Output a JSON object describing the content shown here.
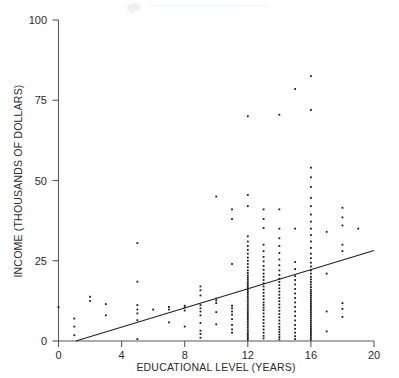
{
  "chart_data": {
    "type": "scatter",
    "title": "",
    "xlabel": "EDUCATIONAL LEVEL (YEARS)",
    "ylabel": "INCOME (THOUSANDS OF DOLLARS)",
    "xlim": [
      0,
      20
    ],
    "ylim": [
      0,
      100
    ],
    "xticks": [
      0,
      4,
      8,
      12,
      16,
      20
    ],
    "yticks": [
      0,
      25,
      50,
      75,
      100
    ],
    "xtick_labels": [
      "0",
      "4",
      "8",
      "12",
      "16",
      "20"
    ],
    "ytick_labels": [
      "0",
      "25",
      "50",
      "75",
      "100"
    ],
    "grid": false,
    "legend": null,
    "marker": "dot",
    "marker_color": "#1b1b1b",
    "axis_color": "#555a5c",
    "trendline": {
      "label": "regression line",
      "color": "#232323",
      "x_start": 1.1,
      "y_start": 0,
      "x_end": 20,
      "y_end": 28.2,
      "slope": 1.49,
      "intercept": -1.64
    },
    "points": [
      [
        0,
        10.5
      ],
      [
        1,
        1.8
      ],
      [
        1,
        4.5
      ],
      [
        1,
        7.0
      ],
      [
        2,
        12.5
      ],
      [
        2,
        13.8
      ],
      [
        3,
        8.0
      ],
      [
        3,
        11.5
      ],
      [
        5,
        0.6
      ],
      [
        5,
        6.5
      ],
      [
        5,
        8.6
      ],
      [
        5,
        9.8
      ],
      [
        5,
        11.2
      ],
      [
        5,
        18.5
      ],
      [
        5,
        30.5
      ],
      [
        6,
        9.8
      ],
      [
        7,
        5.8
      ],
      [
        7,
        9.8
      ],
      [
        7,
        10.6
      ],
      [
        8,
        4.5
      ],
      [
        8,
        9.5
      ],
      [
        8,
        10.5
      ],
      [
        8,
        11.0
      ],
      [
        9,
        1.0
      ],
      [
        9,
        2.2
      ],
      [
        9,
        3.2
      ],
      [
        9,
        5.6
      ],
      [
        9,
        8.0
      ],
      [
        9,
        9.2
      ],
      [
        9,
        10.2
      ],
      [
        9,
        11.2
      ],
      [
        9,
        14.2
      ],
      [
        9,
        15.8
      ],
      [
        9,
        17.0
      ],
      [
        10,
        5.2
      ],
      [
        10,
        9.0
      ],
      [
        10,
        11.8
      ],
      [
        10,
        12.6
      ],
      [
        10,
        13.2
      ],
      [
        10,
        45.0
      ],
      [
        11,
        2.6
      ],
      [
        11,
        3.6
      ],
      [
        11,
        5.0
      ],
      [
        11,
        6.8
      ],
      [
        11,
        8.2
      ],
      [
        11,
        9.2
      ],
      [
        11,
        10.2
      ],
      [
        11,
        11.0
      ],
      [
        11,
        24.0
      ],
      [
        11,
        38.0
      ],
      [
        11,
        41.0
      ],
      [
        12,
        0.4
      ],
      [
        12,
        0.9
      ],
      [
        12,
        1.4
      ],
      [
        12,
        1.9
      ],
      [
        12,
        2.4
      ],
      [
        12,
        3.0
      ],
      [
        12,
        3.6
      ],
      [
        12,
        4.2
      ],
      [
        12,
        4.8
      ],
      [
        12,
        5.4
      ],
      [
        12,
        6.0
      ],
      [
        12,
        6.6
      ],
      [
        12,
        7.2
      ],
      [
        12,
        7.8
      ],
      [
        12,
        8.4
      ],
      [
        12,
        9.0
      ],
      [
        12,
        9.6
      ],
      [
        12,
        10.2
      ],
      [
        12,
        10.8
      ],
      [
        12,
        11.4
      ],
      [
        12,
        12.0
      ],
      [
        12,
        12.6
      ],
      [
        12,
        13.2
      ],
      [
        12,
        13.8
      ],
      [
        12,
        14.4
      ],
      [
        12,
        15.0
      ],
      [
        12,
        15.6
      ],
      [
        12,
        16.2
      ],
      [
        12,
        16.8
      ],
      [
        12,
        17.4
      ],
      [
        12,
        18.0
      ],
      [
        12,
        18.6
      ],
      [
        12,
        19.2
      ],
      [
        12,
        19.8
      ],
      [
        12,
        20.4
      ],
      [
        12,
        21.2
      ],
      [
        12,
        22.0
      ],
      [
        12,
        23.0
      ],
      [
        12,
        24.0
      ],
      [
        12,
        25.0
      ],
      [
        12,
        26.0
      ],
      [
        12,
        27.2
      ],
      [
        12,
        28.4
      ],
      [
        12,
        29.6
      ],
      [
        12,
        31.0
      ],
      [
        12,
        32.6
      ],
      [
        12,
        42.0
      ],
      [
        12,
        45.5
      ],
      [
        12,
        70.0
      ],
      [
        13,
        0.8
      ],
      [
        13,
        1.6
      ],
      [
        13,
        2.6
      ],
      [
        13,
        3.6
      ],
      [
        13,
        4.6
      ],
      [
        13,
        5.6
      ],
      [
        13,
        6.6
      ],
      [
        13,
        7.6
      ],
      [
        13,
        8.6
      ],
      [
        13,
        9.6
      ],
      [
        13,
        10.4
      ],
      [
        13,
        11.2
      ],
      [
        13,
        12.0
      ],
      [
        13,
        13.0
      ],
      [
        13,
        14.0
      ],
      [
        13,
        15.0
      ],
      [
        13,
        16.0
      ],
      [
        13,
        17.0
      ],
      [
        13,
        18.0
      ],
      [
        13,
        19.0
      ],
      [
        13,
        20.0
      ],
      [
        13,
        21.0
      ],
      [
        13,
        22.2
      ],
      [
        13,
        23.4
      ],
      [
        13,
        24.8
      ],
      [
        13,
        26.2
      ],
      [
        13,
        28.0
      ],
      [
        13,
        30.0
      ],
      [
        13,
        35.2
      ],
      [
        13,
        38.0
      ],
      [
        13,
        41.0
      ],
      [
        14,
        0.5
      ],
      [
        14,
        1.2
      ],
      [
        14,
        2.0
      ],
      [
        14,
        2.8
      ],
      [
        14,
        3.6
      ],
      [
        14,
        4.4
      ],
      [
        14,
        5.4
      ],
      [
        14,
        6.4
      ],
      [
        14,
        7.4
      ],
      [
        14,
        8.4
      ],
      [
        14,
        9.4
      ],
      [
        14,
        10.4
      ],
      [
        14,
        11.4
      ],
      [
        14,
        12.4
      ],
      [
        14,
        13.4
      ],
      [
        14,
        14.4
      ],
      [
        14,
        15.4
      ],
      [
        14,
        16.4
      ],
      [
        14,
        17.4
      ],
      [
        14,
        18.4
      ],
      [
        14,
        19.4
      ],
      [
        14,
        20.6
      ],
      [
        14,
        22.0
      ],
      [
        14,
        23.6
      ],
      [
        14,
        25.4
      ],
      [
        14,
        27.4
      ],
      [
        14,
        29.6
      ],
      [
        14,
        32.0
      ],
      [
        14,
        35.0
      ],
      [
        14,
        41.0
      ],
      [
        14,
        70.5
      ],
      [
        15,
        0.6
      ],
      [
        15,
        1.5
      ],
      [
        15,
        2.6
      ],
      [
        15,
        3.8
      ],
      [
        15,
        5.0
      ],
      [
        15,
        6.4
      ],
      [
        15,
        7.8
      ],
      [
        15,
        9.2
      ],
      [
        15,
        10.6
      ],
      [
        15,
        12.0
      ],
      [
        15,
        13.4
      ],
      [
        15,
        14.8
      ],
      [
        15,
        16.2
      ],
      [
        15,
        17.6
      ],
      [
        15,
        19.0
      ],
      [
        15,
        20.2
      ],
      [
        15,
        22.4
      ],
      [
        15,
        24.6
      ],
      [
        15,
        35.0
      ],
      [
        16,
        0.4
      ],
      [
        16,
        1.0
      ],
      [
        16,
        1.6
      ],
      [
        16,
        2.2
      ],
      [
        16,
        2.8
      ],
      [
        16,
        3.4
      ],
      [
        16,
        4.0
      ],
      [
        16,
        4.6
      ],
      [
        16,
        5.2
      ],
      [
        16,
        5.8
      ],
      [
        16,
        6.4
      ],
      [
        16,
        7.0
      ],
      [
        16,
        7.6
      ],
      [
        16,
        8.2
      ],
      [
        16,
        8.8
      ],
      [
        16,
        9.4
      ],
      [
        16,
        10.0
      ],
      [
        16,
        10.6
      ],
      [
        16,
        11.2
      ],
      [
        16,
        11.8
      ],
      [
        16,
        12.4
      ],
      [
        16,
        13.0
      ],
      [
        16,
        13.6
      ],
      [
        16,
        14.2
      ],
      [
        16,
        14.8
      ],
      [
        16,
        15.4
      ],
      [
        16,
        16.0
      ],
      [
        16,
        16.8
      ],
      [
        16,
        17.6
      ],
      [
        16,
        18.4
      ],
      [
        16,
        19.2
      ],
      [
        16,
        20.0
      ],
      [
        16,
        21.0
      ],
      [
        16,
        22.0
      ],
      [
        16,
        23.2
      ],
      [
        16,
        24.4
      ],
      [
        16,
        25.8
      ],
      [
        16,
        27.2
      ],
      [
        16,
        29.0
      ],
      [
        16,
        31.0
      ],
      [
        16,
        33.0
      ],
      [
        16,
        35.0
      ],
      [
        16,
        37.2
      ],
      [
        16,
        39.4
      ],
      [
        16,
        42.0
      ],
      [
        16,
        44.6
      ],
      [
        16,
        48.0
      ],
      [
        16,
        51.0
      ],
      [
        16,
        54.0
      ],
      [
        16,
        72.0
      ],
      [
        16,
        82.5
      ],
      [
        15,
        78.5
      ],
      [
        17,
        3.0
      ],
      [
        17,
        9.2
      ],
      [
        17,
        21.0
      ],
      [
        17,
        34.0
      ],
      [
        18,
        7.5
      ],
      [
        18,
        10.0
      ],
      [
        18,
        11.8
      ],
      [
        18,
        28.0
      ],
      [
        18,
        30.0
      ],
      [
        18,
        36.0
      ],
      [
        18,
        38.5
      ],
      [
        18,
        41.5
      ],
      [
        19,
        35.0
      ]
    ]
  },
  "axes": {
    "y_top_label": "100",
    "x_right_label": "20"
  }
}
